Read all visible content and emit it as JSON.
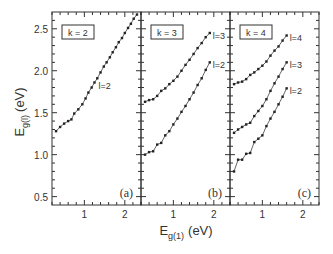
{
  "chart_data": {
    "type": "line",
    "title": "",
    "xlabel": "E_g(1) (eV)",
    "xlabel_main": "E",
    "xlabel_sub": "g(1)",
    "xlabel_unit": "(eV)",
    "ylabel": "E_g(l) (eV)",
    "ylabel_main": "E",
    "ylabel_sub": "g(l)",
    "ylabel_unit": "(eV)",
    "ylim": [
      0.4,
      2.7
    ],
    "xlim": [
      0.2,
      2.4
    ],
    "y_ticks": [
      "0.5",
      "1.0",
      "1.5",
      "2.0",
      "2.5"
    ],
    "y_tick_values": [
      0.5,
      1.0,
      1.5,
      2.0,
      2.5
    ],
    "x_ticks": [
      "1",
      "2"
    ],
    "x_tick_values": [
      1,
      2
    ],
    "grid": false,
    "panels": [
      {
        "id": "a",
        "label": "(a)",
        "k_label": "k = 2",
        "series": [
          {
            "name": "l=2",
            "label": "l=2",
            "x": [
              0.3,
              0.4,
              0.5,
              0.6,
              0.68,
              0.75,
              0.85,
              0.95,
              1.03,
              1.1,
              1.18,
              1.25,
              1.32,
              1.4,
              1.48,
              1.55,
              1.63,
              1.7,
              1.78,
              1.85,
              1.93,
              2.0,
              2.08,
              2.15,
              2.22,
              2.3
            ],
            "y": [
              1.28,
              1.33,
              1.37,
              1.4,
              1.42,
              1.49,
              1.54,
              1.6,
              1.67,
              1.74,
              1.8,
              1.86,
              1.91,
              1.98,
              2.05,
              2.1,
              2.16,
              2.22,
              2.28,
              2.34,
              2.39,
              2.45,
              2.51,
              2.56,
              2.62,
              2.67
            ]
          }
        ]
      },
      {
        "id": "b",
        "label": "(b)",
        "k_label": "k = 3",
        "series": [
          {
            "name": "l=3",
            "label": "l=3",
            "x": [
              0.3,
              0.4,
              0.5,
              0.6,
              0.7,
              0.8,
              0.9,
              1.0,
              1.1,
              1.2,
              1.3,
              1.4,
              1.5,
              1.6,
              1.7,
              1.8,
              1.9
            ],
            "y": [
              1.63,
              1.65,
              1.66,
              1.7,
              1.76,
              1.79,
              1.84,
              1.88,
              1.93,
              2.0,
              2.07,
              2.13,
              2.2,
              2.27,
              2.33,
              2.4,
              2.45
            ]
          },
          {
            "name": "l=2",
            "label": "l=2",
            "x": [
              0.3,
              0.4,
              0.5,
              0.6,
              0.7,
              0.8,
              0.9,
              1.0,
              1.1,
              1.2,
              1.3,
              1.4,
              1.5,
              1.6,
              1.7,
              1.8,
              1.9
            ],
            "y": [
              1.0,
              1.03,
              1.04,
              1.12,
              1.14,
              1.23,
              1.28,
              1.36,
              1.43,
              1.51,
              1.58,
              1.66,
              1.74,
              1.83,
              1.91,
              2.01,
              2.1
            ]
          }
        ]
      },
      {
        "id": "c",
        "label": "(c)",
        "k_label": "k = 4",
        "series": [
          {
            "name": "l=4",
            "label": "l=4",
            "x": [
              0.3,
              0.4,
              0.5,
              0.6,
              0.7,
              0.8,
              0.9,
              1.0,
              1.1,
              1.2,
              1.3,
              1.4,
              1.5,
              1.6
            ],
            "y": [
              1.84,
              1.86,
              1.87,
              1.9,
              1.95,
              1.98,
              2.02,
              2.06,
              2.11,
              2.18,
              2.24,
              2.29,
              2.36,
              2.42
            ]
          },
          {
            "name": "l=3",
            "label": "l=3",
            "x": [
              0.3,
              0.4,
              0.5,
              0.6,
              0.7,
              0.8,
              0.9,
              1.0,
              1.1,
              1.2,
              1.3,
              1.4,
              1.5,
              1.6
            ],
            "y": [
              1.26,
              1.3,
              1.33,
              1.36,
              1.38,
              1.46,
              1.52,
              1.58,
              1.66,
              1.76,
              1.85,
              1.93,
              2.02,
              2.1
            ]
          },
          {
            "name": "l=2",
            "label": "l=2",
            "x": [
              0.3,
              0.4,
              0.5,
              0.6,
              0.7,
              0.8,
              0.9,
              1.0,
              1.1,
              1.2,
              1.3,
              1.4,
              1.5,
              1.6
            ],
            "y": [
              0.8,
              0.94,
              0.94,
              1.01,
              1.02,
              1.15,
              1.19,
              1.23,
              1.34,
              1.43,
              1.51,
              1.6,
              1.69,
              1.79
            ]
          }
        ]
      }
    ]
  },
  "style": {
    "line_color": "#555555",
    "axis_color": "#333333",
    "marker_color": "#222222"
  }
}
